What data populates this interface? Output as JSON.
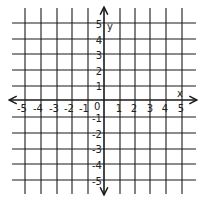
{
  "diagram": {
    "type": "coordinate-plane",
    "axes": {
      "x_label": "x",
      "y_label": "y",
      "origin_label": "0",
      "x_ticks": [
        "-5",
        "-4",
        "-3",
        "-2",
        "-1",
        "1",
        "2",
        "3",
        "4",
        "5"
      ],
      "y_ticks": [
        "5",
        "4",
        "3",
        "2",
        "1",
        "-1",
        "-2",
        "-3",
        "-4",
        "-5"
      ]
    },
    "range": {
      "x": [
        -5,
        5
      ],
      "y": [
        -5,
        5
      ]
    },
    "colors": {
      "line": "#1a1a1a",
      "background": "#ffffff"
    }
  }
}
